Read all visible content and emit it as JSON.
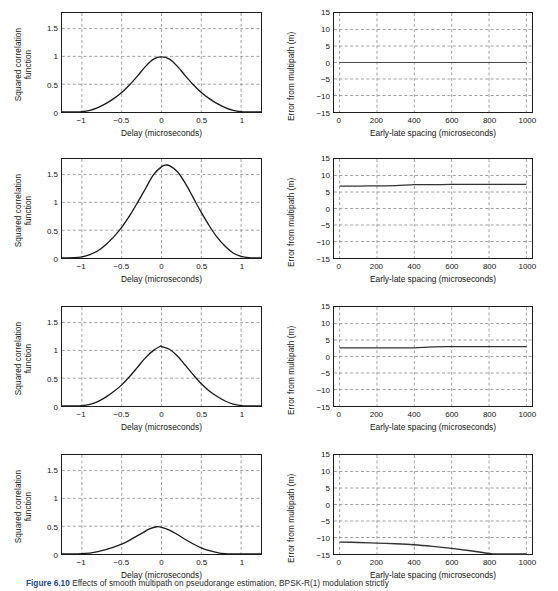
{
  "figure": {
    "caption_label": "Figure",
    "caption_number": "6.10",
    "caption_text": "Effects of smooth multipath on pseudorange estimation, BPSK-R(1) modulation strictly"
  },
  "axes": {
    "left": {
      "ylabel_line1": "Squared correlation",
      "ylabel_line2": "function",
      "xlabel": "Delay (microseconds)",
      "xticks": [
        "−1",
        "−0.5",
        "0",
        "0.5",
        "1"
      ],
      "xtick_values": [
        -1,
        -0.5,
        0,
        0.5,
        1
      ],
      "yticks": [
        "0",
        "0.5",
        "1",
        "1.5"
      ],
      "ytick_values": [
        0,
        0.5,
        1,
        1.5
      ],
      "xlim": [
        -1.25,
        1.25
      ],
      "ylim": [
        0,
        1.78
      ]
    },
    "right": {
      "ylabel": "Error from multipath (m)",
      "xlabel": "Early-late spacing (microseconds)",
      "xticks": [
        "0",
        "200",
        "400",
        "600",
        "800",
        "1000"
      ],
      "xtick_values": [
        0,
        200,
        400,
        600,
        800,
        1000
      ],
      "yticks": [
        "−15",
        "−10",
        "−5",
        "0",
        "5",
        "10",
        "15"
      ],
      "ytick_values": [
        -15,
        -10,
        -5,
        0,
        5,
        10,
        15
      ],
      "xlim": [
        -30,
        1030
      ],
      "ylim": [
        -15,
        15
      ]
    }
  },
  "colors": {
    "curve": "#1c1c1c",
    "axis": "#1c1c1c",
    "grid": "#8a8a8a",
    "background": "#ffffff"
  },
  "chart_data": [
    {
      "id": "row1-left",
      "type": "line",
      "title": "",
      "xlabel": "Delay (microseconds)",
      "ylabel": "Squared correlation function",
      "xlim": [
        -1.25,
        1.25
      ],
      "ylim": [
        0,
        1.78
      ],
      "grid": true,
      "peak_value": 0.99,
      "peak_x": 0.0,
      "x": [
        -1.25,
        -1.1,
        -1.0,
        -0.9,
        -0.8,
        -0.7,
        -0.6,
        -0.5,
        -0.4,
        -0.3,
        -0.2,
        -0.1,
        0.0,
        0.1,
        0.2,
        0.3,
        0.4,
        0.5,
        0.6,
        0.7,
        0.8,
        0.9,
        1.0,
        1.1,
        1.25
      ],
      "values": [
        0.0,
        0.0,
        0.005,
        0.03,
        0.08,
        0.15,
        0.24,
        0.35,
        0.49,
        0.65,
        0.82,
        0.95,
        0.99,
        0.95,
        0.82,
        0.65,
        0.49,
        0.35,
        0.24,
        0.15,
        0.08,
        0.03,
        0.005,
        0.0,
        0.0
      ]
    },
    {
      "id": "row1-right",
      "type": "line",
      "title": "",
      "xlabel": "Early-late spacing (microseconds)",
      "ylabel": "Error from multipath (m)",
      "xlim": [
        -30,
        1030
      ],
      "ylim": [
        -15,
        15
      ],
      "grid": true,
      "x": [
        0,
        100,
        200,
        300,
        400,
        500,
        600,
        700,
        800,
        900,
        1000
      ],
      "values": [
        0.0,
        0.0,
        0.0,
        0.0,
        0.0,
        0.0,
        0.0,
        0.0,
        0.0,
        0.0,
        0.0
      ]
    },
    {
      "id": "row2-left",
      "type": "line",
      "title": "",
      "xlabel": "Delay (microseconds)",
      "ylabel": "Squared correlation function",
      "xlim": [
        -1.25,
        1.25
      ],
      "ylim": [
        0,
        1.78
      ],
      "grid": true,
      "peak_value": 1.67,
      "peak_x": 0.02,
      "x": [
        -1.25,
        -1.1,
        -1.0,
        -0.9,
        -0.8,
        -0.7,
        -0.6,
        -0.5,
        -0.4,
        -0.3,
        -0.2,
        -0.1,
        0.0,
        0.05,
        0.1,
        0.2,
        0.3,
        0.4,
        0.5,
        0.6,
        0.7,
        0.8,
        0.9,
        1.0,
        1.1,
        1.25
      ],
      "values": [
        0.0,
        0.005,
        0.02,
        0.06,
        0.13,
        0.24,
        0.38,
        0.55,
        0.76,
        1.0,
        1.25,
        1.5,
        1.64,
        1.67,
        1.66,
        1.55,
        1.34,
        1.08,
        0.82,
        0.58,
        0.37,
        0.21,
        0.09,
        0.03,
        0.005,
        0.0
      ]
    },
    {
      "id": "row2-right",
      "type": "line",
      "title": "",
      "xlabel": "Early-late spacing (microseconds)",
      "ylabel": "Error from multipath (m)",
      "xlim": [
        -30,
        1030
      ],
      "ylim": [
        -15,
        15
      ],
      "grid": true,
      "x": [
        0,
        100,
        200,
        300,
        400,
        500,
        600,
        700,
        800,
        900,
        1000
      ],
      "values": [
        6.8,
        6.8,
        6.85,
        6.9,
        7.2,
        7.25,
        7.3,
        7.3,
        7.3,
        7.3,
        7.3
      ]
    },
    {
      "id": "row3-left",
      "type": "line",
      "title": "",
      "xlabel": "Delay (microseconds)",
      "ylabel": "Squared correlation function",
      "xlim": [
        -1.25,
        1.25
      ],
      "ylim": [
        0,
        1.78
      ],
      "grid": true,
      "peak_value": 1.07,
      "peak_x": -0.02,
      "x": [
        -1.25,
        -1.1,
        -1.0,
        -0.9,
        -0.8,
        -0.7,
        -0.6,
        -0.5,
        -0.4,
        -0.3,
        -0.2,
        -0.1,
        -0.02,
        0.0,
        0.1,
        0.2,
        0.3,
        0.4,
        0.5,
        0.6,
        0.7,
        0.8,
        0.9,
        1.0,
        1.1,
        1.25
      ],
      "values": [
        0.0,
        0.0,
        0.005,
        0.03,
        0.08,
        0.16,
        0.26,
        0.38,
        0.53,
        0.7,
        0.87,
        1.0,
        1.07,
        1.07,
        1.02,
        0.9,
        0.73,
        0.56,
        0.4,
        0.27,
        0.17,
        0.09,
        0.035,
        0.008,
        0.0,
        0.0
      ]
    },
    {
      "id": "row3-right",
      "type": "line",
      "title": "",
      "xlabel": "Early-late spacing (microseconds)",
      "ylabel": "Error from multipath (m)",
      "xlim": [
        -30,
        1030
      ],
      "ylim": [
        -15,
        15
      ],
      "grid": true,
      "x": [
        0,
        100,
        200,
        300,
        400,
        500,
        600,
        700,
        800,
        900,
        1000
      ],
      "values": [
        2.6,
        2.6,
        2.6,
        2.62,
        2.65,
        2.95,
        3.0,
        3.0,
        3.0,
        3.0,
        3.0
      ]
    },
    {
      "id": "row4-left",
      "type": "line",
      "title": "",
      "xlabel": "Delay (microseconds)",
      "ylabel": "Squared correlation function",
      "xlim": [
        -1.25,
        1.25
      ],
      "ylim": [
        0,
        1.78
      ],
      "grid": true,
      "peak_value": 0.49,
      "peak_x": -0.06,
      "x": [
        -1.25,
        -1.15,
        -1.05,
        -0.95,
        -0.85,
        -0.75,
        -0.65,
        -0.55,
        -0.45,
        -0.35,
        -0.25,
        -0.15,
        -0.06,
        0.0,
        0.1,
        0.2,
        0.3,
        0.4,
        0.5,
        0.6,
        0.7,
        0.8,
        0.9,
        1.0,
        1.25
      ],
      "values": [
        0.0,
        0.0,
        0.0,
        0.01,
        0.03,
        0.06,
        0.1,
        0.15,
        0.21,
        0.29,
        0.37,
        0.45,
        0.49,
        0.48,
        0.43,
        0.35,
        0.26,
        0.18,
        0.11,
        0.06,
        0.025,
        0.005,
        0.0,
        0.0,
        0.0
      ]
    },
    {
      "id": "row4-right",
      "type": "line",
      "title": "",
      "xlabel": "Early-late spacing (microseconds)",
      "ylabel": "Error from multipath (m)",
      "xlim": [
        -30,
        1030
      ],
      "ylim": [
        -15,
        15
      ],
      "grid": true,
      "x": [
        0,
        100,
        200,
        300,
        400,
        500,
        600,
        700,
        800,
        850,
        900,
        1000
      ],
      "values": [
        -11.4,
        -11.5,
        -11.7,
        -11.9,
        -12.2,
        -12.7,
        -13.3,
        -14.0,
        -14.8,
        -15.0,
        -15.0,
        -15.0
      ]
    }
  ]
}
